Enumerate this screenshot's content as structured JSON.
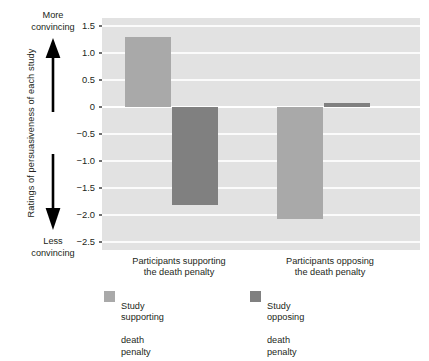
{
  "chart_data": {
    "type": "bar",
    "title": "",
    "xlabel": "",
    "ylabel": "Ratings of persuasiveness of each study",
    "ylim": [
      -2.5,
      1.5
    ],
    "yticks": [
      1.5,
      1.0,
      0.5,
      0,
      -0.5,
      -1.0,
      -1.5,
      -2.0,
      -2.5
    ],
    "ytick_labels": [
      "1.5",
      "1.0",
      "0.5",
      "0",
      "−0.5",
      "−1.0",
      "−1.5",
      "−2.0",
      "−2.5"
    ],
    "grid": true,
    "legend_position": "bottom",
    "categories": [
      "Participants supporting\nthe death penalty",
      "Participants opposing\nthe death penalty"
    ],
    "series": [
      {
        "name": "Study supporting\ndeath penalty",
        "color": "#a9a9a9",
        "values": [
          1.3,
          -2.07
        ]
      },
      {
        "name": "Study opposing\ndeath penalty",
        "color": "#808080",
        "values": [
          -1.82,
          0.08
        ]
      }
    ],
    "annotations": {
      "axis_top": "More\nconvincing",
      "axis_bottom": "Less\nconvincing"
    }
  },
  "axis": {
    "y_title": "Ratings of persuasiveness of each study",
    "ticks": [
      {
        "label": "1.5",
        "value": 1.5
      },
      {
        "label": "1.0",
        "value": 1.0
      },
      {
        "label": "0.5",
        "value": 0.5
      },
      {
        "label": "0",
        "value": 0
      },
      {
        "label": "−0.5",
        "value": -0.5
      },
      {
        "label": "−1.0",
        "value": -1.0
      },
      {
        "label": "−1.5",
        "value": -1.5
      },
      {
        "label": "−2.0",
        "value": -2.0
      },
      {
        "label": "−2.5",
        "value": -2.5
      }
    ]
  },
  "annotations": {
    "more_convincing_line1": "More",
    "more_convincing_line2": "convincing",
    "less_convincing_line1": "Less",
    "less_convincing_line2": "convincing"
  },
  "categories": [
    {
      "line1": "Participants supporting",
      "line2": "the death penalty"
    },
    {
      "line1": "Participants opposing",
      "line2": "the death penalty"
    }
  ],
  "legend": [
    {
      "line1": "Study supporting",
      "line2": "death penalty",
      "color": "#a9a9a9"
    },
    {
      "line1": "Study opposing",
      "line2": "death penalty",
      "color": "#808080"
    }
  ],
  "colors": {
    "panel_background": "#e2e2e2",
    "gridline": "#fbfbfb",
    "zeroline": "#ffffff",
    "light_bar": "#a9a9a9",
    "dark_bar": "#808080",
    "text": "#231f20"
  }
}
